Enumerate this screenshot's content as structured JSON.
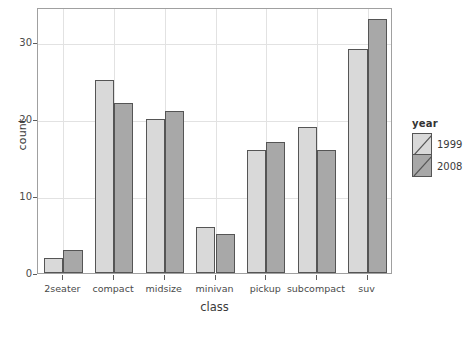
{
  "chart_data": {
    "type": "bar",
    "title": "",
    "subtitle": "",
    "xlabel": "class",
    "ylabel": "count",
    "categories": [
      "2seater",
      "compact",
      "midsize",
      "minivan",
      "pickup",
      "subcompact",
      "suv"
    ],
    "series": [
      {
        "name": "1999",
        "color": "#d9d9d9",
        "values": [
          2,
          25,
          20,
          6,
          16,
          19,
          29
        ]
      },
      {
        "name": "2008",
        "color": "#a8a8a8",
        "values": [
          3,
          22,
          21,
          5,
          17,
          16,
          33
        ]
      }
    ],
    "ylim": [
      0,
      34.5
    ],
    "yticks": [
      0,
      10,
      20,
      30
    ],
    "ytick_labels": [
      "0",
      "10",
      "20",
      "30"
    ],
    "grid": true,
    "grid_color": "#e2e2e2",
    "legend": {
      "title": "year",
      "position": "right",
      "entries": [
        {
          "label": "1999",
          "color": "#d9d9d9"
        },
        {
          "label": "2008",
          "color": "#a8a8a8"
        }
      ]
    },
    "bar_outline_color": "#555555",
    "panel_border_color": "#a0a0a0",
    "background": "#ffffff",
    "bar_position": "dodge"
  }
}
